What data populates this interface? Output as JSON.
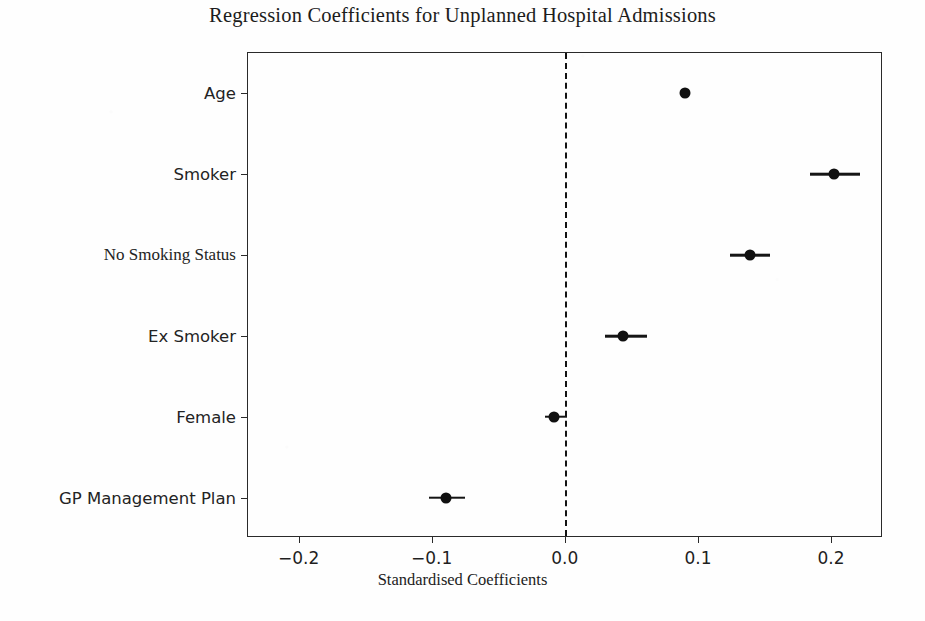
{
  "chart_data": {
    "type": "scatter",
    "title": "Regression Coefficients for Unplanned Hospital Admissions",
    "subtitle": "",
    "xlabel": "Standardised Coefficients",
    "ylabel": "",
    "orientation": "horizontal",
    "grid": false,
    "legend": null,
    "xlim": [
      -0.238,
      0.239
    ],
    "xticks": [
      -0.2,
      -0.1,
      0.0,
      0.1,
      0.2
    ],
    "xticklabels": [
      "−0.2",
      "−0.1",
      "0.0",
      "0.1",
      "0.2"
    ],
    "reference_line": {
      "x": 0.0,
      "style": "dashed",
      "color": "#121212"
    },
    "categories": [
      "Age",
      "Smoker",
      "No Smoking Status",
      "Ex Smoker",
      "Female",
      "GP Management Plan"
    ],
    "values": [
      0.09,
      0.202,
      0.139,
      0.044,
      -0.008,
      -0.089
    ],
    "ci_low": [
      0.088,
      0.184,
      0.124,
      0.03,
      -0.015,
      -0.102
    ],
    "ci_high": [
      0.093,
      0.222,
      0.154,
      0.062,
      0.002,
      -0.075
    ],
    "points": [
      {
        "label": "Age",
        "value": 0.09,
        "ci_low": 0.088,
        "ci_high": 0.093
      },
      {
        "label": "Smoker",
        "value": 0.202,
        "ci_low": 0.184,
        "ci_high": 0.222
      },
      {
        "label": "No Smoking Status",
        "value": 0.139,
        "ci_low": 0.124,
        "ci_high": 0.154
      },
      {
        "label": "Ex Smoker",
        "value": 0.044,
        "ci_low": 0.03,
        "ci_high": 0.062
      },
      {
        "label": "Female",
        "value": -0.008,
        "ci_low": -0.015,
        "ci_high": 0.002
      },
      {
        "label": "GP Management Plan",
        "value": -0.089,
        "ci_low": -0.102,
        "ci_high": -0.075
      }
    ],
    "marker_color": "#101010",
    "errorbar_color": "#151515"
  }
}
